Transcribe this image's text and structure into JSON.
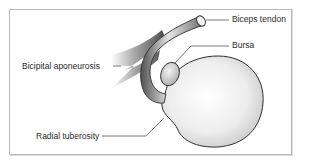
{
  "diagram": {
    "type": "anatomical-illustration",
    "labels": {
      "biceps_tendon": "Biceps tendon",
      "bursa": "Bursa",
      "bicipital_aponeurosis": "Bicipital aponeurosis",
      "radial_tuberosity": "Radial tuberosity"
    },
    "colors": {
      "frame": "#b9b9b9",
      "outline": "#2f2f2f",
      "leader": "#555555",
      "tendon_dark": "#5a5a5a",
      "tendon_light": "#d9d9d9",
      "bone_light": "#f7f7f7",
      "bone_shade": "#cfcfcf"
    }
  }
}
